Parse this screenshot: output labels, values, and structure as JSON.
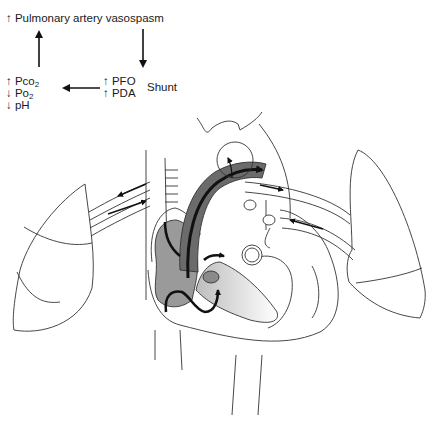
{
  "flow": {
    "top": {
      "arrow": "↑",
      "text": "Pulmonary artery vasospasm"
    },
    "right": {
      "line1": {
        "arrow": "↑",
        "text": "PFO"
      },
      "line2": {
        "arrow": "↑",
        "text": "PDA"
      },
      "result": "Shunt"
    },
    "left": {
      "line1": {
        "arrow": "↑",
        "text": "Pco",
        "sub": "2"
      },
      "line2": {
        "arrow": "↓",
        "text": "Po",
        "sub": "2"
      },
      "line3": {
        "arrow": "↓",
        "text": "pH"
      }
    }
  },
  "illustration": {
    "subject": "heart-and-lungs",
    "shunt_fill_color": "#6b6b6b",
    "chamber_fill_color": "#9a9a9a",
    "outline_color": "#333333"
  }
}
